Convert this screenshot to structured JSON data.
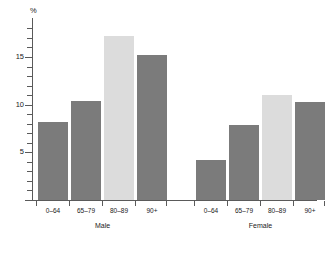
{
  "chart_data": {
    "type": "bar",
    "title": "",
    "xlabel": "",
    "ylabel": "%",
    "ylim": [
      0,
      18.5
    ],
    "yticks": [
      0,
      5,
      10,
      15
    ],
    "ytick_labels": [
      "0",
      "5",
      "10",
      "15"
    ],
    "minor_tick_step": 1,
    "grid": false,
    "legend": "none",
    "groups": [
      "Male",
      "Female"
    ],
    "categories": [
      "0–64",
      "65–79",
      "80–89",
      "90+"
    ],
    "series": [
      {
        "name": "Male",
        "values": [
          8.2,
          10.4,
          17.2,
          15.2
        ],
        "colors": [
          "#7b7b7b",
          "#7b7b7b",
          "#dcdcdc",
          "#7b7b7b"
        ]
      },
      {
        "name": "Female",
        "values": [
          4.2,
          7.9,
          11.0,
          10.3
        ],
        "colors": [
          "#7b7b7b",
          "#7b7b7b",
          "#dcdcdc",
          "#7b7b7b"
        ]
      }
    ],
    "bar_colors": {
      "standard": "#7b7b7b",
      "highlight": "#dcdcdc"
    },
    "axis_color": "#5a5a5a",
    "background": "#ffffff"
  }
}
